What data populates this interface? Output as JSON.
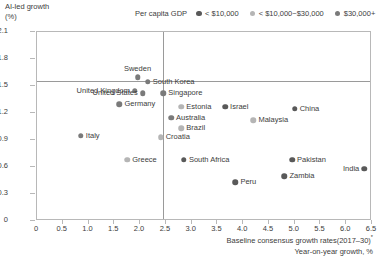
{
  "axis": {
    "y_title_line1": "AI-led growth",
    "y_title_line2": "(%)",
    "x_title_line1": "Baseline consensus growth rates(2017–30)",
    "x_title_footnote": "*",
    "x_title_line2": "Year-on-year growth, %",
    "yticks": [
      "0",
      "0.3",
      "0.6",
      "0.9",
      "1.2",
      "1.5",
      "1.8",
      "2.1"
    ],
    "xticks": [
      "0",
      "0.5",
      "1.0",
      "1.5",
      "2.0",
      "2.5",
      "3.0",
      "3.5",
      "4.0",
      "4.5",
      "5.0",
      "5.5",
      "6.0",
      "6.5"
    ]
  },
  "legend": {
    "title": "Per capita GDP",
    "items": [
      {
        "label": "< $10,000",
        "color": "#595959"
      },
      {
        "label": "< $10,000~$30,000",
        "color": "#b5b5b5"
      },
      {
        "label": "$30,000+",
        "color": "#7a7a7a"
      }
    ]
  },
  "chart_data": {
    "type": "scatter",
    "title": "",
    "xlabel": "Baseline consensus growth rates(2017–30), Year-on-year growth, %",
    "ylabel": "AI-led growth (%)",
    "xlim": [
      0,
      6.5
    ],
    "ylim": [
      0,
      2.1
    ],
    "grid": false,
    "legend_position": "top-right",
    "reference_lines": [
      {
        "orientation": "vertical",
        "value": 2.45
      },
      {
        "orientation": "horizontal",
        "value": 1.56
      }
    ],
    "series": [
      {
        "name": "< $10,000",
        "color": "#595959",
        "points": [
          {
            "label": "Israel",
            "x": 3.65,
            "y": 1.27,
            "lpos": "right"
          },
          {
            "label": "China",
            "x": 5.0,
            "y": 1.25,
            "lpos": "right"
          },
          {
            "label": "South Africa",
            "x": 2.85,
            "y": 0.68,
            "lpos": "right"
          },
          {
            "label": "Peru",
            "x": 3.85,
            "y": 0.43,
            "lpos": "right"
          },
          {
            "label": "Pakistan",
            "x": 4.95,
            "y": 0.68,
            "lpos": "right"
          },
          {
            "label": "Zambia",
            "x": 4.8,
            "y": 0.5,
            "lpos": "right"
          },
          {
            "label": "India",
            "x": 6.35,
            "y": 0.58,
            "lpos": "left"
          }
        ]
      },
      {
        "name": "< $10,000~$30,000",
        "color": "#b5b5b5",
        "points": [
          {
            "label": "Estonia",
            "x": 2.8,
            "y": 1.27,
            "lpos": "right"
          },
          {
            "label": "Brazil",
            "x": 2.8,
            "y": 1.03,
            "lpos": "right"
          },
          {
            "label": "Croatia",
            "x": 2.4,
            "y": 0.93,
            "lpos": "right"
          },
          {
            "label": "Greece",
            "x": 1.75,
            "y": 0.68,
            "lpos": "right"
          },
          {
            "label": "Malaysia",
            "x": 4.2,
            "y": 1.12,
            "lpos": "right"
          }
        ]
      },
      {
        "name": "$30,000+",
        "color": "#7a7a7a",
        "points": [
          {
            "label": "Sweden",
            "x": 1.95,
            "y": 1.6,
            "lpos": "above"
          },
          {
            "label": "South Korea",
            "x": 2.15,
            "y": 1.55,
            "lpos": "right"
          },
          {
            "label": "United Kingdom",
            "x": 1.9,
            "y": 1.45,
            "lpos": "left"
          },
          {
            "label": "United States",
            "x": 2.05,
            "y": 1.42,
            "lpos": "left"
          },
          {
            "label": "Germany",
            "x": 1.6,
            "y": 1.3,
            "lpos": "right"
          },
          {
            "label": "Italy",
            "x": 0.85,
            "y": 0.95,
            "lpos": "right"
          },
          {
            "label": "Singapore",
            "x": 2.45,
            "y": 1.42,
            "lpos": "right"
          },
          {
            "label": "Australia",
            "x": 2.6,
            "y": 1.15,
            "lpos": "right"
          }
        ]
      }
    ]
  }
}
